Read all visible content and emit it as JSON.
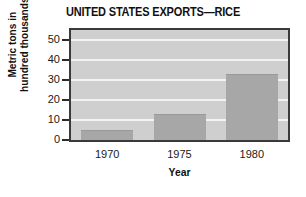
{
  "chart_data": {
    "type": "bar",
    "title": "UNITED STATES EXPORTS—RICE",
    "xlabel": "Year",
    "ylabel": "Metric tons in\nhundred thousands",
    "categories": [
      "1970",
      "1975",
      "1980"
    ],
    "values": [
      5,
      13,
      33
    ],
    "series": [
      {
        "name": "Rice exports",
        "values": [
          5,
          13,
          33
        ]
      }
    ],
    "ylim": [
      0,
      55
    ],
    "yticks": [
      0,
      10,
      20,
      30,
      40,
      50
    ],
    "ytick_labels": [
      "0",
      "10",
      "20",
      "30",
      "40",
      "50"
    ],
    "grid": true,
    "grid_axis": "y",
    "legend": false,
    "legend_position": "none",
    "colors": {
      "bar_fill": "#a7a7a7",
      "plot_background": "#cfcfcf",
      "gridline": "#f2f2f2",
      "axis_frame": "#3a3a3a",
      "text": "#111111",
      "page_background": "#ffffff"
    }
  }
}
